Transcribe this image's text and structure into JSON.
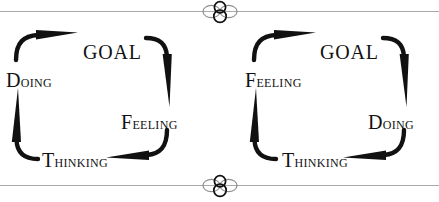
{
  "page": {
    "background_color": "#ffffff",
    "ink_color": "#121212",
    "rule_color": "#a9a9a9"
  },
  "ornaments": {
    "top": {
      "name": "circle-cluster-ornament"
    },
    "bottom": {
      "name": "circle-cluster-ornament"
    }
  },
  "diagrams": [
    {
      "id": "left",
      "nodes": {
        "goal": "GOAL",
        "doing": "Doing",
        "feeling": "Feeling",
        "thinking": "Thinking"
      },
      "cycle": [
        "Doing",
        "GOAL",
        "Feeling",
        "Thinking",
        "Doing"
      ]
    },
    {
      "id": "right",
      "nodes": {
        "goal": "GOAL",
        "feeling": "Feeling",
        "doing": "Doing",
        "thinking": "Thinking"
      },
      "cycle": [
        "Feeling",
        "GOAL",
        "Doing",
        "Thinking",
        "Feeling"
      ]
    }
  ]
}
